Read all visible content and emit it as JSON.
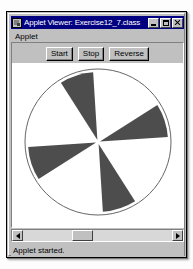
{
  "window": {
    "title": "Applet Viewer: Exercise12_7.class",
    "icon": "applet-viewer-icon",
    "controls": [
      {
        "name": "minimize",
        "glyph": "minimize-icon"
      },
      {
        "name": "maximize",
        "glyph": "maximize-icon"
      },
      {
        "name": "close",
        "glyph": "close-icon"
      }
    ]
  },
  "menubar": {
    "items": [
      {
        "label": "Applet"
      }
    ]
  },
  "toolbar": {
    "buttons": [
      {
        "label": "Start",
        "name": "start-button"
      },
      {
        "label": "Stop",
        "name": "stop-button"
      },
      {
        "label": "Reverse",
        "name": "reverse-button"
      }
    ]
  },
  "canvas": {
    "background": "#ffffff",
    "circle": {
      "cx": 86,
      "cy": 79,
      "r": 73,
      "stroke": "#666666",
      "fill": "#ffffff"
    },
    "fan": {
      "blade_color": "#4d4d4d",
      "blade_count": 4,
      "blade_span_degrees": 28,
      "blade_angles_degrees": [
        18,
        108,
        198,
        288
      ],
      "inner_radius": 2,
      "outer_radius": 70
    }
  },
  "scrollbar": {
    "orientation": "horizontal",
    "left_arrow": "scroll-left-icon",
    "right_arrow": "scroll-right-icon",
    "thumb_position_percent": 38
  },
  "statusbar": {
    "text": "Applet started."
  }
}
